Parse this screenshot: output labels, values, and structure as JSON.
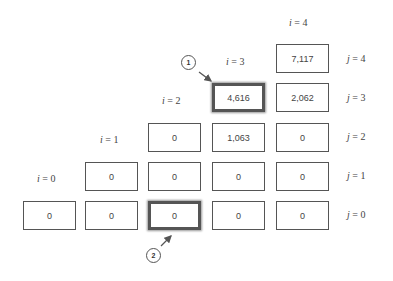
{
  "grid": {
    "columns": [
      {
        "i": 0,
        "label": "i = 0"
      },
      {
        "i": 1,
        "label": "i = 1"
      },
      {
        "i": 2,
        "label": "i = 2"
      },
      {
        "i": 3,
        "label": "i = 3"
      },
      {
        "i": 4,
        "label": "i = 4"
      }
    ],
    "rows": [
      {
        "j": 4,
        "label": "j = 4"
      },
      {
        "j": 3,
        "label": "j = 3"
      },
      {
        "j": 2,
        "label": "j = 2"
      },
      {
        "j": 1,
        "label": "j = 1"
      },
      {
        "j": 0,
        "label": "j = 0"
      }
    ],
    "cells": {
      "c4_4": "7,117",
      "c3_3": "4,616",
      "c4_3": "2,062",
      "c2_2": "0",
      "c3_2": "1,063",
      "c4_2": "0",
      "c1_1": "0",
      "c2_1": "0",
      "c3_1": "0",
      "c4_1": "0",
      "c0_0": "0",
      "c1_0": "0",
      "c2_0": "0",
      "c3_0": "0",
      "c4_0": "0"
    }
  },
  "callouts": [
    {
      "number": "1",
      "target": "cell i=3, j=3 (4,616)"
    },
    {
      "number": "2",
      "target": "cell i=2, j=0 (0)"
    }
  ]
}
